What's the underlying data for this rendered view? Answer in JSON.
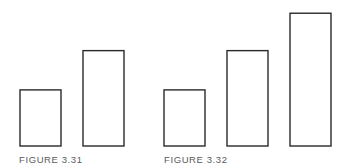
{
  "figures": [
    {
      "caption": "FIGURE 3.31",
      "bars": [
        {
          "name": "bar-1",
          "value": 3
        },
        {
          "name": "bar-2",
          "value": 5.1
        }
      ]
    },
    {
      "caption": "FIGURE 3.32",
      "bars": [
        {
          "name": "bar-1",
          "value": 3
        },
        {
          "name": "bar-2",
          "value": 5.1
        },
        {
          "name": "bar-3",
          "value": 7.1
        }
      ]
    }
  ],
  "chart_data": [
    {
      "type": "bar",
      "title": "FIGURE 3.31",
      "categories": [
        "1",
        "2"
      ],
      "values": [
        3,
        5.1
      ],
      "xlabel": "",
      "ylabel": "",
      "grid": false,
      "axes": false
    },
    {
      "type": "bar",
      "title": "FIGURE 3.32",
      "categories": [
        "1",
        "2",
        "3"
      ],
      "values": [
        3,
        5.1,
        7.1
      ],
      "xlabel": "",
      "ylabel": "",
      "grid": false,
      "axes": false
    }
  ]
}
